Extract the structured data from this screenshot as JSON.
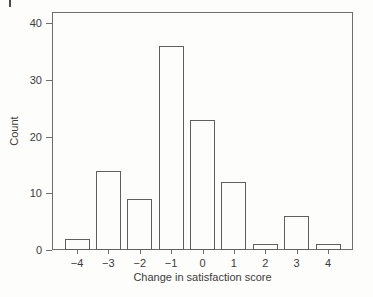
{
  "figure": {
    "scan_artifact": "partial-mark-top-left"
  },
  "colors": {
    "background": "#fdfdfb",
    "frame_line": "#6e6e6e",
    "bar_outline": "#5f5f5f",
    "text": "#3c3c3c"
  },
  "chart_data": {
    "type": "bar",
    "subtype": "histogram",
    "title": "",
    "xlabel": "Change in satisfaction score",
    "ylabel": "Count",
    "categories": [
      "-4",
      "-3",
      "-2",
      "-1",
      "0",
      "1",
      "2",
      "3",
      "4"
    ],
    "values": [
      2,
      14,
      9,
      36,
      23,
      12,
      1,
      6,
      1
    ],
    "ylim": [
      0,
      40
    ],
    "yticks": [
      0,
      10,
      20,
      30,
      40
    ],
    "grid": false,
    "legend": "none",
    "bar_fill": "white",
    "frame": "full-box"
  }
}
